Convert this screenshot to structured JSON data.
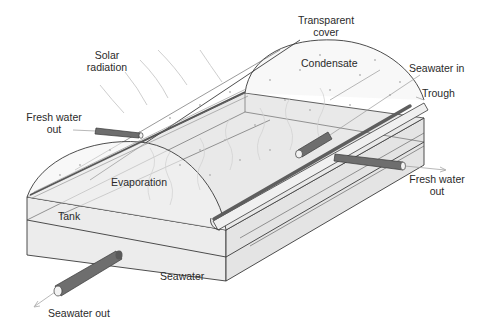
{
  "diagram": {
    "labels": {
      "solar_radiation": [
        "Solar",
        "radiation"
      ],
      "transparent_cover": [
        "Transparent",
        "cover"
      ],
      "condensate": "Condensate",
      "seawater_in": "Seawater in",
      "trough": "Trough",
      "fresh_water_out_left": [
        "Fresh water",
        "out"
      ],
      "fresh_water_out_right": [
        "Fresh water",
        "out"
      ],
      "evaporation": "Evaporation",
      "tank": "Tank",
      "seawater": "Seawater",
      "seawater_out": "Seawater out"
    },
    "colors": {
      "background": "#ffffff",
      "line": "#3a3a3a",
      "tank_front": "#ececec",
      "tank_side": "#e4e4e4",
      "water_surface": "#e9e9e9",
      "cover_fill": "#f7f7f7",
      "pipe": "#6e6e6e"
    }
  }
}
